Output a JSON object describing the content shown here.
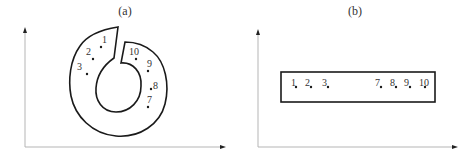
{
  "figure": {
    "panels": [
      {
        "id": "a",
        "label": "(a)",
        "shape": "open ring (C-shaped annulus with a gap at the top)",
        "points": [
          {
            "label": "1",
            "x": 101,
            "y": 47
          },
          {
            "label": "2",
            "x": 93,
            "y": 59
          },
          {
            "label": "3",
            "x": 87,
            "y": 74
          },
          {
            "label": "10",
            "x": 136,
            "y": 59
          },
          {
            "label": "9",
            "x": 148,
            "y": 71
          },
          {
            "label": "8",
            "x": 151,
            "y": 89
          },
          {
            "label": "7",
            "x": 148,
            "y": 107
          }
        ]
      },
      {
        "id": "b",
        "label": "(b)",
        "shape": "rectangle (unrolled ring)",
        "points": [
          {
            "label": "1",
            "x": 296,
            "y": 87
          },
          {
            "label": "2",
            "x": 311,
            "y": 87
          },
          {
            "label": "3",
            "x": 328,
            "y": 87
          },
          {
            "label": "7",
            "x": 381,
            "y": 87
          },
          {
            "label": "8",
            "x": 396,
            "y": 87
          },
          {
            "label": "9",
            "x": 410,
            "y": 87
          },
          {
            "label": "10",
            "x": 425,
            "y": 87
          }
        ]
      }
    ],
    "colors": {
      "axis": "#b5b5b5",
      "stroke": "#1a1a1a",
      "text": "#333333"
    }
  }
}
